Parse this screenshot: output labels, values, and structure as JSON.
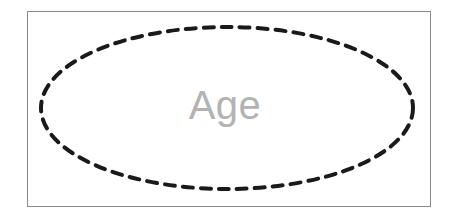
{
  "figure": {
    "kind": "er-diagram-entity",
    "caption": "",
    "background_color": "#ffffff"
  },
  "frame": {
    "name": "diagram-border",
    "border_color": "#8a8a8a",
    "border_width_px": 1,
    "fill_color": "#ffffff",
    "x": 27,
    "y": 11,
    "width": 404,
    "height": 196
  },
  "entity": {
    "shape": "ellipse",
    "label": "Age",
    "label_color": "#b3b3b3",
    "label_font_size_px": 40,
    "stroke_color": "#1a1a1a",
    "stroke_width_px": 4,
    "stroke_style": "dashed",
    "dash_length_px": 10,
    "dash_gap_px": 8,
    "fill_color": "#ffffff",
    "center_x": 227,
    "center_y": 108,
    "radius_x": 186,
    "radius_y": 81
  }
}
